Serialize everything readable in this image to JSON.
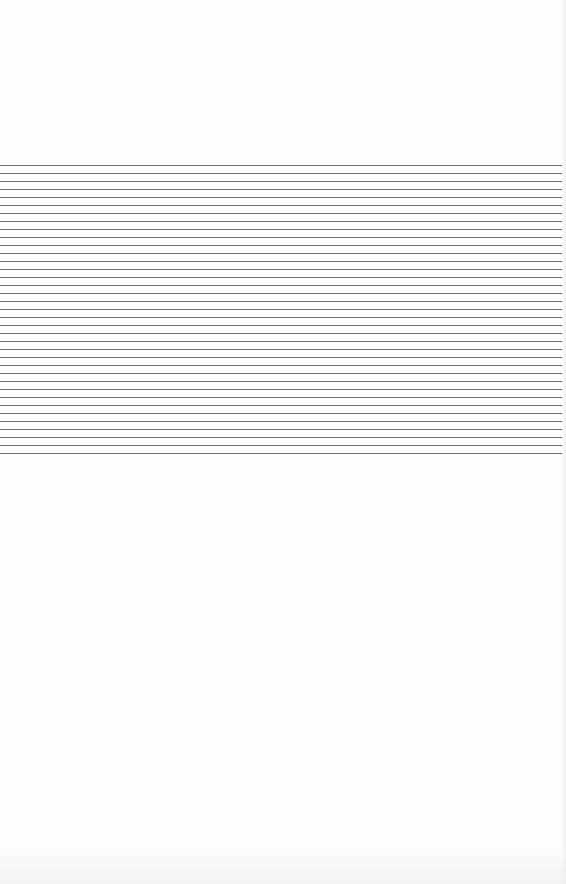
{
  "page": {
    "type": "lined-paper",
    "background_color": "#fdfdfd",
    "line_color": "#6e6e6e"
  },
  "ruled_area": {
    "first_line_y": 165,
    "line_spacing_px": 8,
    "line_count": 37,
    "line_width_px": 564
  }
}
